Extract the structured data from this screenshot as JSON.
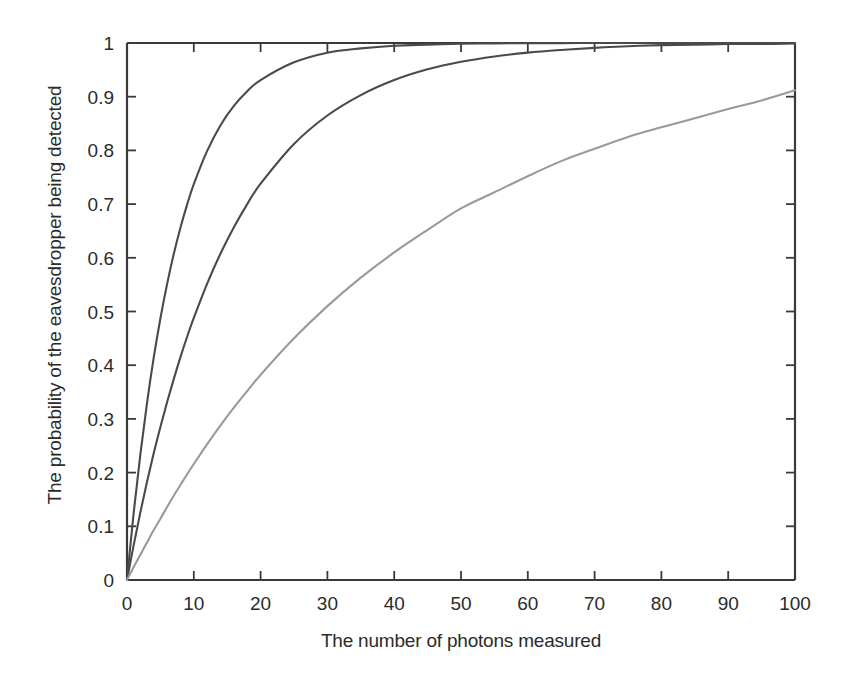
{
  "chart_data": {
    "type": "line",
    "title": "",
    "xlabel": "The number of photons measured",
    "ylabel": "The probability of the eavesdropper being detected",
    "xlim": [
      0,
      100
    ],
    "ylim": [
      0,
      1
    ],
    "xticks": [
      "0",
      "10",
      "20",
      "30",
      "40",
      "50",
      "60",
      "70",
      "80",
      "90",
      "100"
    ],
    "xtick_values": [
      0,
      10,
      20,
      30,
      40,
      50,
      60,
      70,
      80,
      90,
      100
    ],
    "yticks": [
      "0",
      "0.1",
      "0.2",
      "0.3",
      "0.4",
      "0.5",
      "0.6",
      "0.7",
      "0.8",
      "0.9",
      "1"
    ],
    "ytick_values": [
      0,
      0.1,
      0.2,
      0.3,
      0.4,
      0.5,
      0.6,
      0.7,
      0.8,
      0.9,
      1
    ],
    "grid": false,
    "legend": "none",
    "x": [
      1,
      2,
      3,
      4,
      5,
      6,
      7,
      8,
      9,
      10,
      12,
      14,
      16,
      18,
      20,
      25,
      30,
      35,
      40,
      45,
      50,
      55,
      60,
      65,
      70,
      75,
      80,
      85,
      90,
      95,
      100
    ],
    "series": [
      {
        "name": "steep-curve",
        "color": "#4a4a4a",
        "values": [
          0.125,
          0.234,
          0.33,
          0.414,
          0.487,
          0.551,
          0.607,
          0.656,
          0.699,
          0.737,
          0.799,
          0.847,
          0.883,
          0.91,
          0.931,
          0.964,
          0.982,
          0.99,
          0.995,
          0.997,
          0.9987,
          0.9993,
          0.9996,
          0.9998,
          0.9999,
          0.9999,
          1.0,
          1.0,
          1.0,
          1.0,
          1.0
        ]
      },
      {
        "name": "middle-curve",
        "color": "#4a4a4a",
        "values": [
          0.065,
          0.126,
          0.183,
          0.236,
          0.285,
          0.331,
          0.374,
          0.415,
          0.453,
          0.488,
          0.552,
          0.608,
          0.657,
          0.7,
          0.738,
          0.812,
          0.865,
          0.903,
          0.931,
          0.951,
          0.965,
          0.975,
          0.982,
          0.987,
          0.991,
          0.994,
          0.996,
          0.997,
          0.998,
          0.998,
          0.999
        ]
      },
      {
        "name": "shallow-curve",
        "color": "#9a9a9a",
        "values": [
          0.024,
          0.047,
          0.07,
          0.093,
          0.114,
          0.136,
          0.157,
          0.177,
          0.197,
          0.216,
          0.253,
          0.288,
          0.321,
          0.352,
          0.382,
          0.45,
          0.51,
          0.563,
          0.61,
          0.652,
          0.692,
          0.722,
          0.752,
          0.78,
          0.803,
          0.825,
          0.843,
          0.86,
          0.877,
          0.893,
          0.912
        ]
      }
    ]
  }
}
